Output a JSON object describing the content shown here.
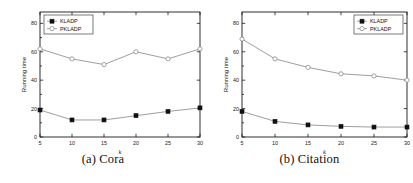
{
  "figure": {
    "panels": [
      {
        "caption_index": "(a)",
        "caption_label": "Cora",
        "legend_position": "top-left"
      },
      {
        "caption_index": "(b)",
        "caption_label": "Citation",
        "legend_position": "top-right"
      }
    ]
  },
  "axes": {
    "xlabel": "k",
    "ylabel": "Running time",
    "xticks": [
      "5",
      "10",
      "15",
      "20",
      "25",
      "30"
    ],
    "yticks": [
      "0",
      "20",
      "40",
      "60",
      "80"
    ]
  },
  "legend": {
    "kladp": "KLADP",
    "pkladp": "PKLADP"
  },
  "colors": {
    "line": "#8d8d8d",
    "marker_filled": "#111111",
    "marker_open": "#ffffff",
    "axis": "#1a1a1a",
    "background": "#ffffff"
  },
  "chart_data": [
    {
      "type": "line",
      "title": "(a) Cora",
      "xlabel": "k",
      "ylabel": "Running time",
      "x": [
        5,
        10,
        15,
        20,
        25,
        30
      ],
      "xlim": [
        5,
        30
      ],
      "ylim": [
        0,
        88
      ],
      "yticks": [
        0,
        20,
        40,
        60,
        80
      ],
      "grid": false,
      "legend_position": "top-left",
      "series": [
        {
          "name": "KLADP",
          "marker": "filled-square",
          "values": [
            19,
            12,
            12,
            15,
            18,
            20.5
          ]
        },
        {
          "name": "PKLADP",
          "marker": "open-circle",
          "values": [
            62,
            55,
            51,
            60,
            55,
            62
          ]
        }
      ]
    },
    {
      "type": "line",
      "title": "(b) Citation",
      "xlabel": "k",
      "ylabel": "Running time",
      "x": [
        5,
        10,
        15,
        20,
        25,
        30
      ],
      "xlim": [
        5,
        30
      ],
      "ylim": [
        0,
        88
      ],
      "yticks": [
        0,
        20,
        40,
        60,
        80
      ],
      "grid": false,
      "legend_position": "top-right",
      "series": [
        {
          "name": "KLADP",
          "marker": "filled-square",
          "values": [
            18,
            11,
            8.5,
            7.5,
            7,
            7
          ]
        },
        {
          "name": "PKLADP",
          "marker": "open-circle",
          "values": [
            69,
            55,
            49,
            44.5,
            43,
            40
          ]
        }
      ]
    }
  ]
}
